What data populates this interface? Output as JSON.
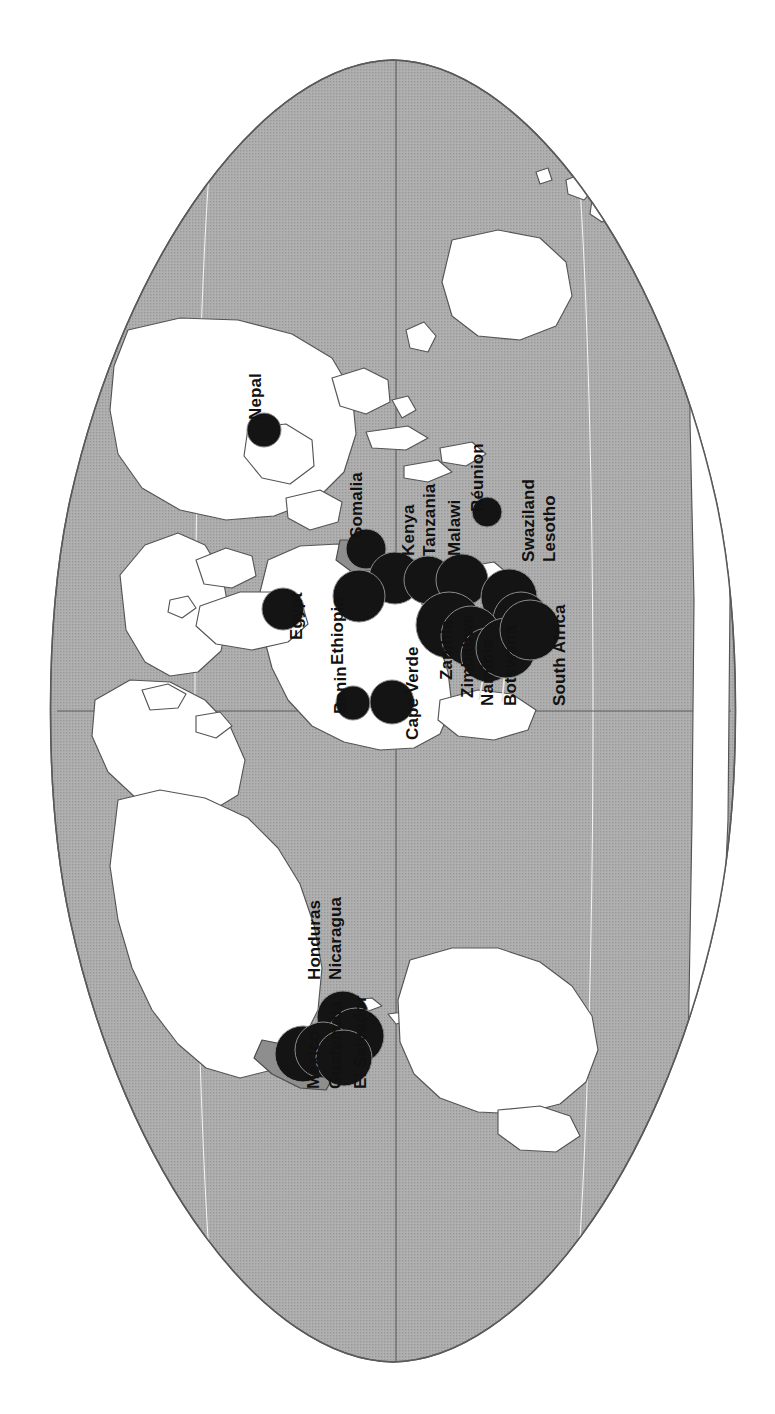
{
  "figure": {
    "type": "map",
    "orientation": "rotated-90-clockwise",
    "projection": "oval world projection (Eckert / Mollweide style)",
    "background_color": "#ffffff",
    "ocean_color": "#a9a9a9",
    "land_color": "#ffffff",
    "border_color": "#4a4a4a",
    "symbol_color": "#141414",
    "symbol_stroke_color": "#8c8c8c",
    "graticule_color_light": "#f2f2f2",
    "graticule_color_dark": "#4a4a4a"
  },
  "chart_data": {
    "type": "scatter",
    "title": "",
    "subtitle": "",
    "xlabel": "",
    "ylabel": "",
    "legend": [],
    "annotations": [],
    "note": "Proportional black circles placed over countries; circle area encodes magnitude.",
    "points": [
      {
        "name": "Nepal",
        "cx": 264,
        "cy": 430,
        "r": 17,
        "label_x": 247,
        "label_y": 420,
        "label_rot": -90,
        "leader": null
      },
      {
        "name": "Somalia",
        "cx": 366,
        "cy": 549,
        "r": 20,
        "label_x": 348,
        "label_y": 538,
        "label_rot": -90,
        "leader": null
      },
      {
        "name": "Kenya",
        "cx": 395,
        "cy": 578,
        "r": 26,
        "label_x": 400,
        "label_y": 556,
        "label_rot": -90,
        "leader": null
      },
      {
        "name": "Tanzania",
        "cx": 428,
        "cy": 580,
        "r": 24,
        "label_x": 421,
        "label_y": 556,
        "label_rot": -90,
        "leader": null
      },
      {
        "name": "Malawi",
        "cx": 462,
        "cy": 580,
        "r": 26,
        "label_x": 446,
        "label_y": 556,
        "label_rot": -90,
        "leader": null
      },
      {
        "name": "Réunion",
        "cx": 487,
        "cy": 512,
        "r": 15,
        "label_x": 469,
        "label_y": 512,
        "label_rot": -90,
        "leader": null
      },
      {
        "name": "Swaziland",
        "cx": 509,
        "cy": 597,
        "r": 28,
        "label_x": 520,
        "label_y": 562,
        "label_rot": -90,
        "leader": null
      },
      {
        "name": "Lesotho",
        "cx": 521,
        "cy": 620,
        "r": 28,
        "label_x": 541,
        "label_y": 562,
        "label_rot": -90,
        "leader": null
      },
      {
        "name": "Egypt",
        "cx": 283,
        "cy": 609,
        "r": 21,
        "label_x": 288,
        "label_y": 640,
        "label_rot": -90,
        "leader": null
      },
      {
        "name": "Ethiopia",
        "cx": 359,
        "cy": 596,
        "r": 26,
        "label_x": 329,
        "label_y": 665,
        "label_rot": -90,
        "leader": null
      },
      {
        "name": "Benin",
        "cx": 353,
        "cy": 703,
        "r": 17,
        "label_x": 332,
        "label_y": 714,
        "label_rot": -90,
        "leader": null
      },
      {
        "name": "Cape Verde",
        "cx": 392,
        "cy": 702,
        "r": 22,
        "label_x": 404,
        "label_y": 740,
        "label_rot": -90,
        "leader": null
      },
      {
        "name": "Zambia",
        "cx": 449,
        "cy": 625,
        "r": 33,
        "label_x": 438,
        "label_y": 680,
        "label_rot": -90,
        "leader": null
      },
      {
        "name": "Zimbabwe",
        "cx": 471,
        "cy": 636,
        "r": 30,
        "label_x": 459,
        "label_y": 698,
        "label_rot": -90,
        "leader": null
      },
      {
        "name": "Namibia",
        "cx": 488,
        "cy": 655,
        "r": 27,
        "label_x": 479,
        "label_y": 706,
        "label_rot": -90,
        "leader": {
          "x1": 492,
          "y1": 628,
          "x2": 479,
          "y2": 700
        }
      },
      {
        "name": "Botswana",
        "cx": 506,
        "cy": 648,
        "r": 30,
        "label_x": 502,
        "label_y": 706,
        "label_rot": -90,
        "leader": {
          "x1": 509,
          "y1": 630,
          "x2": 502,
          "y2": 702
        }
      },
      {
        "name": "South Africa",
        "cx": 530,
        "cy": 630,
        "r": 30,
        "label_x": 551,
        "label_y": 706,
        "label_rot": -90,
        "leader": null
      },
      {
        "name": "Honduras",
        "cx": 343,
        "cy": 1017,
        "r": 26,
        "label_x": 306,
        "label_y": 980,
        "label_rot": -90,
        "leader": null
      },
      {
        "name": "Nicaragua",
        "cx": 356,
        "cy": 1036,
        "r": 28,
        "label_x": 327,
        "label_y": 980,
        "label_rot": -90,
        "leader": null
      },
      {
        "name": "Mexico",
        "cx": 303,
        "cy": 1054,
        "r": 28,
        "label_x": 305,
        "label_y": 1089,
        "label_rot": -90,
        "leader": null
      },
      {
        "name": "Guatemala",
        "cx": 323,
        "cy": 1050,
        "r": 28,
        "label_x": 327,
        "label_y": 1089,
        "label_rot": -90,
        "leader": null
      },
      {
        "name": "El Salvador",
        "cx": 344,
        "cy": 1058,
        "r": 28,
        "label_x": 352,
        "label_y": 1089,
        "label_rot": -90,
        "leader": null
      }
    ]
  },
  "labels": {
    "font_size_px": 17,
    "items": [
      {
        "text": "Nepal"
      },
      {
        "text": "Somalia"
      },
      {
        "text": "Kenya"
      },
      {
        "text": "Tanzania"
      },
      {
        "text": "Malawi"
      },
      {
        "text": "Réunion"
      },
      {
        "text": "Swaziland"
      },
      {
        "text": "Lesotho"
      },
      {
        "text": "Egypt"
      },
      {
        "text": "Ethiopia"
      },
      {
        "text": "Benin"
      },
      {
        "text": "Cape Verde"
      },
      {
        "text": "Zambia"
      },
      {
        "text": "Zimbabwe"
      },
      {
        "text": "Namibia"
      },
      {
        "text": "Botswana"
      },
      {
        "text": "South Africa"
      },
      {
        "text": "Honduras"
      },
      {
        "text": "Nicaragua"
      },
      {
        "text": "Mexico"
      },
      {
        "text": "Guatemala"
      },
      {
        "text": "El Salvador"
      }
    ]
  }
}
